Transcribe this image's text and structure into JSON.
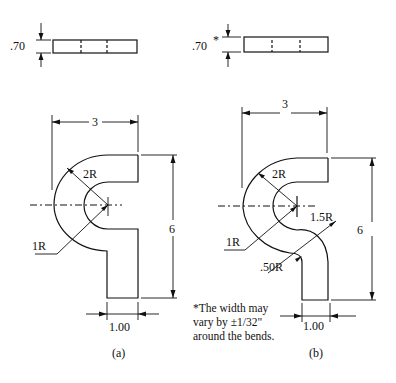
{
  "figure": {
    "panels": [
      {
        "id": "a",
        "caption": "(a)",
        "thickness_label": ".70",
        "width_dim": "3",
        "height_dim": "6",
        "stem_width_dim": "1.00",
        "outer_radius_label": "2R",
        "inner_radius_label": "1R"
      },
      {
        "id": "b",
        "caption": "(b)",
        "thickness_label": ".70",
        "thickness_note_marker": "*",
        "width_dim": "3",
        "height_dim": "6",
        "stem_width_dim": "1.00",
        "outer_radius_label": "2R",
        "inner_radius_label": "1R",
        "reverse_outer_radius_label": "1.5R",
        "reverse_inner_radius_label": ".50R",
        "note_lines": [
          "*The width may",
          "vary by ±1/32\"",
          "around the bends."
        ]
      }
    ]
  }
}
